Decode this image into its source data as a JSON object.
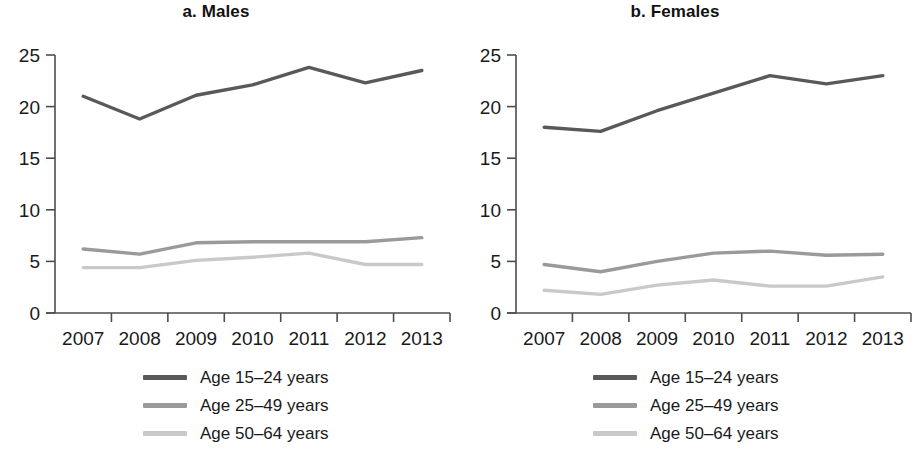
{
  "figure": {
    "width": 921,
    "height": 453
  },
  "colors": {
    "series_15_24": "#595959",
    "series_25_49": "#9a9a9a",
    "series_50_64": "#c9c9c9",
    "axis": "#4d4d4d",
    "text": "#1a1a1a"
  },
  "panels": [
    {
      "id": "males",
      "title": "a. Males",
      "chart_data": {
        "type": "line",
        "title": "a. Males",
        "xlabel": "",
        "ylabel": "",
        "x": [
          "2007",
          "2008",
          "2009",
          "2010",
          "2011",
          "2012",
          "2013"
        ],
        "categories": [
          "2007",
          "2008",
          "2009",
          "2010",
          "2011",
          "2012",
          "2013"
        ],
        "xtick_labels": [
          "2007",
          "2008",
          "2009",
          "2010",
          "2011",
          "2012",
          "2013"
        ],
        "ytick_labels": [
          "0",
          "5",
          "10",
          "15",
          "20",
          "25"
        ],
        "yticks": [
          0,
          5,
          10,
          15,
          20,
          25
        ],
        "ylim": [
          0,
          25
        ],
        "grid": false,
        "legend_position": "below",
        "series": [
          {
            "name": "Age 15–24 years",
            "color": "#595959",
            "values": [
              21.0,
              18.8,
              21.1,
              22.1,
              23.8,
              22.3,
              23.5
            ]
          },
          {
            "name": "Age 25–49 years",
            "color": "#9a9a9a",
            "values": [
              6.2,
              5.7,
              6.8,
              6.9,
              6.9,
              6.9,
              7.3
            ]
          },
          {
            "name": "Age 50–64 years",
            "color": "#c9c9c9",
            "values": [
              4.4,
              4.4,
              5.1,
              5.4,
              5.8,
              4.7,
              4.7
            ]
          }
        ]
      },
      "legend": [
        {
          "label": "Age 15–24 years",
          "color": "#595959"
        },
        {
          "label": "Age 25–49 years",
          "color": "#9a9a9a"
        },
        {
          "label": "Age 50–64 years",
          "color": "#c9c9c9"
        }
      ]
    },
    {
      "id": "females",
      "title": "b. Females",
      "chart_data": {
        "type": "line",
        "title": "b. Females",
        "xlabel": "",
        "ylabel": "",
        "x": [
          "2007",
          "2008",
          "2009",
          "2010",
          "2011",
          "2012",
          "2013"
        ],
        "categories": [
          "2007",
          "2008",
          "2009",
          "2010",
          "2011",
          "2012",
          "2013"
        ],
        "xtick_labels": [
          "2007",
          "2008",
          "2009",
          "2010",
          "2011",
          "2012",
          "2013"
        ],
        "ytick_labels": [
          "0",
          "5",
          "10",
          "15",
          "20",
          "25"
        ],
        "yticks": [
          0,
          5,
          10,
          15,
          20,
          25
        ],
        "ylim": [
          0,
          25
        ],
        "grid": false,
        "legend_position": "below",
        "series": [
          {
            "name": "Age 15–24 years",
            "color": "#595959",
            "values": [
              18.0,
              17.6,
              19.6,
              21.3,
              23.0,
              22.2,
              23.0
            ]
          },
          {
            "name": "Age 25–49 years",
            "color": "#9a9a9a",
            "values": [
              4.7,
              4.0,
              5.0,
              5.8,
              6.0,
              5.6,
              5.7
            ]
          },
          {
            "name": "Age 50–64 years",
            "color": "#c9c9c9",
            "values": [
              2.2,
              1.8,
              2.7,
              3.2,
              2.6,
              2.6,
              3.5
            ]
          }
        ]
      },
      "legend": [
        {
          "label": "Age 15–24 years",
          "color": "#595959"
        },
        {
          "label": "Age 25–49 years",
          "color": "#9a9a9a"
        },
        {
          "label": "Age 50–64 years",
          "color": "#c9c9c9"
        }
      ]
    }
  ]
}
